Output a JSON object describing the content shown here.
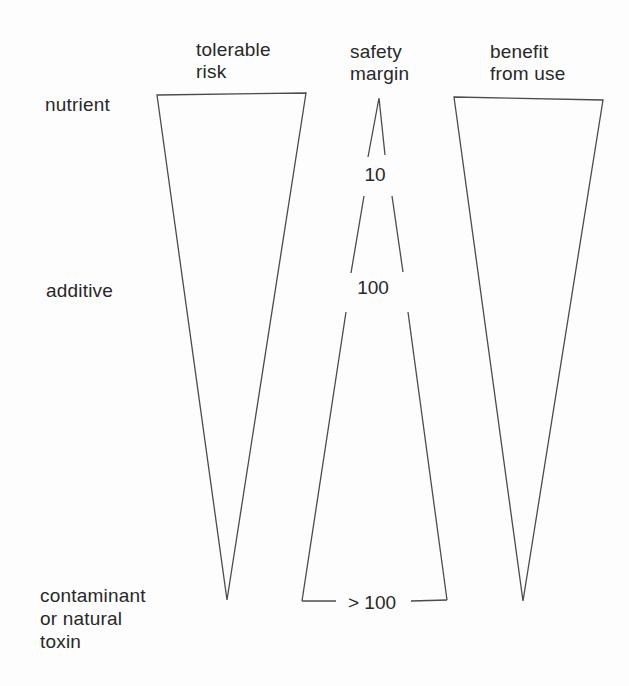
{
  "figure": {
    "background_color": "#fdfdfd",
    "line_color": "#4b4b4b",
    "text_color": "#282828"
  },
  "columns": [
    {
      "id": "tolerable-risk",
      "label": "tolerable\nrisk"
    },
    {
      "id": "safety-margin",
      "label": "safety\nmargin"
    },
    {
      "id": "benefit-from-use",
      "label": "benefit\nfrom use"
    }
  ],
  "rows": [
    {
      "id": "nutrient",
      "label": "nutrient"
    },
    {
      "id": "additive",
      "label": "additive"
    },
    {
      "id": "contaminant",
      "label": "contaminant\nor natural\ntoxin"
    }
  ],
  "safety_margin_values": [
    {
      "row": "nutrient",
      "value": "10"
    },
    {
      "row": "additive",
      "value": "100"
    },
    {
      "row": "contaminant",
      "value": "> 100"
    }
  ]
}
